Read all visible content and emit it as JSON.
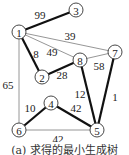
{
  "caption": "(a) 求得的最小生成树",
  "nodes": [
    {
      "id": "1",
      "x": 19,
      "y": 32
    },
    {
      "id": "3",
      "x": 76,
      "y": 10
    },
    {
      "id": "7",
      "x": 115,
      "y": 52
    },
    {
      "id": "8",
      "x": 80,
      "y": 60
    },
    {
      "id": "2",
      "x": 42,
      "y": 77
    },
    {
      "id": "4",
      "x": 51,
      "y": 103
    },
    {
      "id": "6",
      "x": 19,
      "y": 130
    },
    {
      "id": "5",
      "x": 97,
      "y": 130
    }
  ],
  "edges": [
    {
      "from": "1",
      "to": "3",
      "weight": "99",
      "mst": true,
      "lx": 40,
      "ly": 15
    },
    {
      "from": "1",
      "to": "7",
      "weight": "39",
      "mst": false,
      "lx": 70,
      "ly": 36
    },
    {
      "from": "1",
      "to": "8",
      "weight": "49",
      "mst": false,
      "lx": 52,
      "ly": 52
    },
    {
      "from": "1",
      "to": "2",
      "weight": "8",
      "mst": true,
      "lx": 36,
      "ly": 54
    },
    {
      "from": "2",
      "to": "8",
      "weight": "28",
      "mst": true,
      "lx": 62,
      "ly": 75
    },
    {
      "from": "8",
      "to": "7",
      "weight": "58",
      "mst": false,
      "lx": 99,
      "ly": 66
    },
    {
      "from": "8",
      "to": "5",
      "weight": "12",
      "mst": true,
      "lx": 80,
      "ly": 94
    },
    {
      "from": "7",
      "to": "5",
      "weight": "1",
      "mst": true,
      "lx": 115,
      "ly": 97
    },
    {
      "from": "1",
      "to": "6",
      "weight": "65",
      "mst": false,
      "lx": 8,
      "ly": 85
    },
    {
      "from": "6",
      "to": "4",
      "weight": "10",
      "mst": true,
      "lx": 30,
      "ly": 108
    },
    {
      "from": "4",
      "to": "5",
      "weight": "42",
      "mst": true,
      "lx": 76,
      "ly": 108
    },
    {
      "from": "6",
      "to": "5",
      "weight": "42",
      "mst": false,
      "lx": 58,
      "ly": 139
    }
  ]
}
